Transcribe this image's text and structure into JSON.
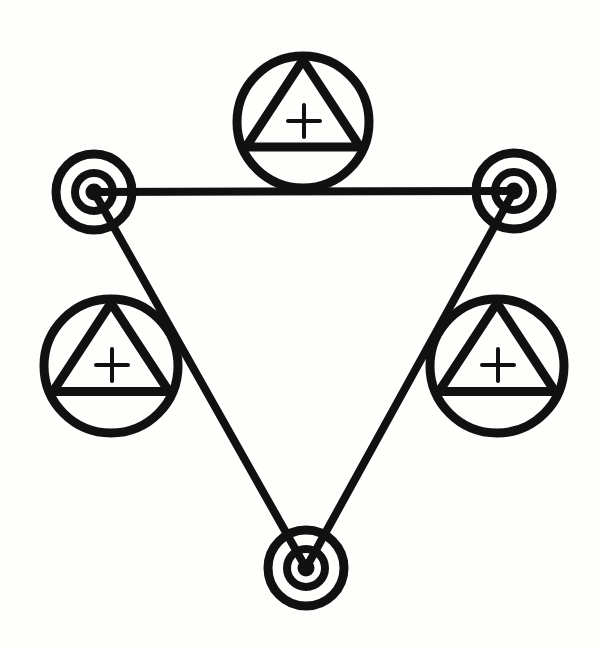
{
  "diagram": {
    "type": "symbolic-triangle",
    "background": "#fefefc",
    "ink": "#111111",
    "stroke_width": 9,
    "targets": [
      {
        "id": "target-top-left",
        "cx": 94,
        "cy": 192,
        "rings": [
          38,
          19
        ],
        "dot": 6
      },
      {
        "id": "target-top-right",
        "cx": 514,
        "cy": 191,
        "rings": [
          38,
          19
        ],
        "dot": 6
      },
      {
        "id": "target-bottom",
        "cx": 306,
        "cy": 568,
        "rings": [
          38,
          19
        ],
        "dot": 6
      }
    ],
    "edges": [
      {
        "id": "edge-top",
        "from": "target-top-left",
        "to": "target-top-right"
      },
      {
        "id": "edge-left",
        "from": "target-top-left",
        "to": "target-bottom"
      },
      {
        "id": "edge-right",
        "from": "target-top-right",
        "to": "target-bottom"
      }
    ],
    "emblems": [
      {
        "id": "emblem-top",
        "cx": 303,
        "cy": 122,
        "r": 66,
        "symbol": "triangle-with-plus"
      },
      {
        "id": "emblem-left",
        "cx": 111,
        "cy": 366,
        "r": 67,
        "symbol": "triangle-with-plus"
      },
      {
        "id": "emblem-right",
        "cx": 497,
        "cy": 366,
        "r": 67,
        "symbol": "triangle-with-plus"
      }
    ]
  }
}
